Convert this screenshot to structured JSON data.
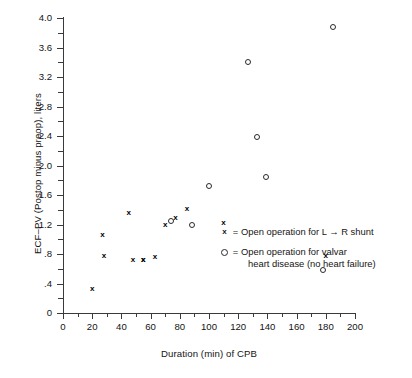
{
  "chart_data": {
    "type": "scatter",
    "title": "",
    "xlabel": "Duration (min) of CPB",
    "ylabel": "ECF–PV (Postop minus preop), liters",
    "xlim": [
      0,
      200
    ],
    "ylim": [
      0,
      4.0
    ],
    "xticks": [
      0,
      20,
      40,
      60,
      80,
      100,
      120,
      140,
      160,
      180,
      200
    ],
    "xtick_labels": [
      "0",
      "20",
      "40",
      "60",
      "80",
      "100",
      "120",
      "140",
      "160",
      "180",
      "200"
    ],
    "xminor_step": 10,
    "yticks": [
      0,
      0.4,
      0.8,
      1.2,
      1.6,
      2.0,
      2.4,
      2.8,
      3.2,
      3.6,
      4.0
    ],
    "ytick_labels": [
      "0",
      ".4",
      ".8",
      "1.2",
      "1.6",
      "2.0",
      "2.4",
      "2.8",
      "3.2",
      "3.6",
      "4.0"
    ],
    "yminor_step": 0.2,
    "grid": false,
    "legend_position": "inside-right",
    "series": [
      {
        "name": "Open operation for L → R shunt",
        "marker": "x",
        "marker_label": "x",
        "points": [
          [
            20,
            0.33
          ],
          [
            27,
            1.07
          ],
          [
            28,
            0.78
          ],
          [
            45,
            1.37
          ],
          [
            48,
            0.73
          ],
          [
            55,
            0.72
          ],
          [
            63,
            0.77
          ],
          [
            70,
            1.2
          ],
          [
            77,
            1.3
          ],
          [
            85,
            1.42
          ],
          [
            55,
            0.72
          ],
          [
            110,
            1.23
          ],
          [
            180,
            0.78
          ]
        ]
      },
      {
        "name": "Open operation for valvar heart disease (no heart failure)",
        "marker": "o",
        "marker_label": "○",
        "points": [
          [
            74,
            1.25
          ],
          [
            100,
            1.72
          ],
          [
            127,
            3.4
          ],
          [
            133,
            2.39
          ],
          [
            139,
            1.85
          ],
          [
            185,
            3.88
          ],
          [
            88,
            1.2
          ],
          [
            178,
            0.59
          ]
        ]
      }
    ],
    "plot_points_px": {
      "note": "rendered from data values via linear axis mapping"
    }
  },
  "legend": {
    "entries": [
      {
        "key": "x",
        "equals": "=",
        "line1": "Open operation for L → R shunt",
        "line2": ""
      },
      {
        "key": "○",
        "equals": "=",
        "line1": "Open operation for valvar",
        "line2": "heart disease (no heart failure)"
      }
    ]
  },
  "colors": {
    "axis": "#3a3a3a",
    "text": "#141414",
    "marker": "#000000",
    "background": "#ffffff"
  }
}
